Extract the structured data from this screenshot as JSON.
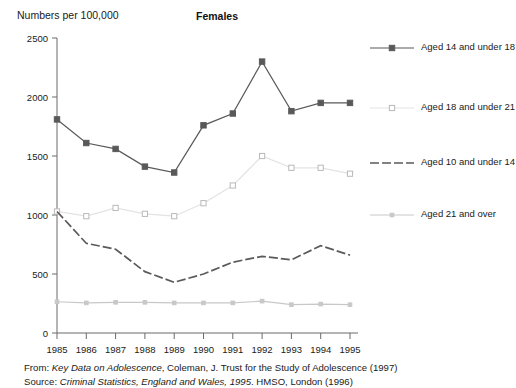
{
  "axis_label_y": "Numbers per 100,000",
  "title": "Females",
  "legend": {
    "items": [
      {
        "label": "Aged 14 and under 18",
        "color": "#595959",
        "marker": "filled-square",
        "dash": "none"
      },
      {
        "label": "Aged 18 and under 21",
        "color": "#e3e3e3",
        "marker": "open-square",
        "dash": "none"
      },
      {
        "label": "Aged 10 and under 14",
        "color": "#5a5a5a",
        "marker": "none",
        "dash": "dashed"
      },
      {
        "label": "Aged 21 and over",
        "color": "#c8c8c8",
        "marker": "small-square",
        "dash": "none"
      }
    ]
  },
  "footnotes": {
    "line1_pre": "From: ",
    "line1_ital": "Key Data on Adolescence",
    "line1_post": ", Coleman, J. Trust for the Study of Adolescence (1997)",
    "line2_pre": "Source: ",
    "line2_ital": "Criminal Statistics, England and Wales, 1995",
    "line2_post": ". HMSO, London (1996)"
  },
  "chart_data": {
    "type": "line",
    "title": "Females",
    "xlabel": "",
    "ylabel": "Numbers per 100,000",
    "x": [
      "1985",
      "1986",
      "1987",
      "1988",
      "1989",
      "1990",
      "1991",
      "1992",
      "1993",
      "1994",
      "1995"
    ],
    "ylim": [
      0,
      2500
    ],
    "yticks": [
      0,
      500,
      1000,
      1500,
      2000,
      2500
    ],
    "grid": false,
    "legend_position": "right",
    "series": [
      {
        "name": "Aged 14 and under 18",
        "color": "#595959",
        "marker": "filled-square",
        "dash": "none",
        "values": [
          1810,
          1610,
          1560,
          1410,
          1360,
          1760,
          1860,
          2300,
          1880,
          1950,
          1950
        ]
      },
      {
        "name": "Aged 18 and under 21",
        "color": "#e3e3e3",
        "marker": "open-square",
        "dash": "none",
        "values": [
          1030,
          990,
          1060,
          1010,
          990,
          1100,
          1250,
          1500,
          1400,
          1400,
          1350
        ]
      },
      {
        "name": "Aged 10 and under 14",
        "color": "#5a5a5a",
        "marker": "none",
        "dash": "dashed",
        "values": [
          1030,
          760,
          710,
          520,
          430,
          500,
          600,
          650,
          620,
          740,
          660
        ]
      },
      {
        "name": "Aged 21 and over",
        "color": "#c8c8c8",
        "marker": "small-square",
        "dash": "none",
        "values": [
          265,
          255,
          260,
          260,
          255,
          255,
          255,
          270,
          240,
          245,
          240
        ]
      }
    ]
  }
}
